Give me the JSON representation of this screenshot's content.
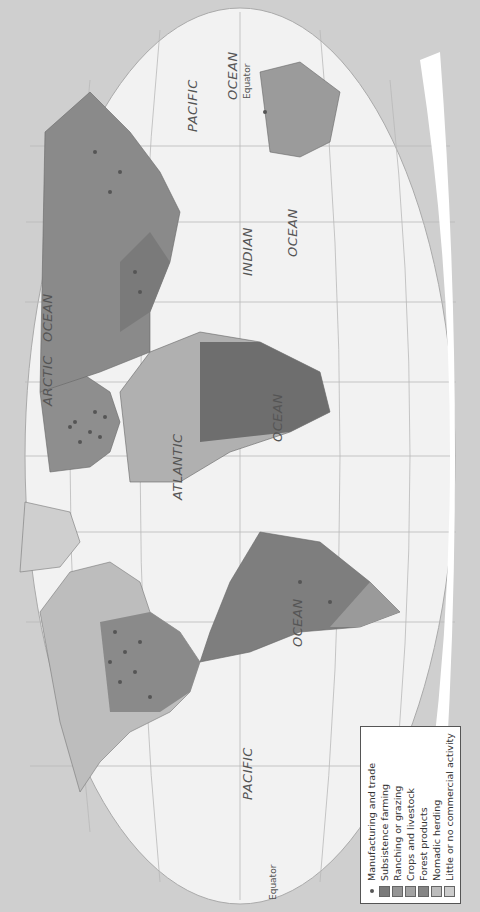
{
  "map": {
    "title": "World economic activity",
    "oceans": [
      {
        "label": "PACIFIC",
        "x": 112,
        "y": 240
      },
      {
        "label": "OCEAN",
        "x": 265,
        "y": 290
      },
      {
        "label": "ATLANTIC",
        "x": 412,
        "y": 170
      },
      {
        "label": "OCEAN",
        "x": 470,
        "y": 270
      },
      {
        "label": "ARCTIC",
        "x": 506,
        "y": 40
      },
      {
        "label": "OCEAN",
        "x": 570,
        "y": 40
      },
      {
        "label": "INDIAN",
        "x": 636,
        "y": 240
      },
      {
        "label": "OCEAN",
        "x": 655,
        "y": 285
      },
      {
        "label": "PACIFIC",
        "x": 780,
        "y": 185
      },
      {
        "label": "OCEAN",
        "x": 812,
        "y": 225
      }
    ],
    "equator_labels": [
      {
        "label": "Equator",
        "x": 12,
        "y": 268
      },
      {
        "label": "Equator",
        "x": 813,
        "y": 242
      }
    ]
  },
  "legend": {
    "items": [
      {
        "label": "Manufacturing and trade",
        "type": "dot",
        "color": "#555555"
      },
      {
        "label": "Subsistence farming",
        "type": "swatch",
        "color": "#7a7a7a"
      },
      {
        "label": "Ranching or grazing",
        "type": "swatch",
        "color": "#959595"
      },
      {
        "label": "Crops and livestock",
        "type": "swatch",
        "color": "#a3a3a3"
      },
      {
        "label": "Forest products",
        "type": "swatch",
        "color": "#858585"
      },
      {
        "label": "Nomadic herding",
        "type": "swatch",
        "color": "#bcbcbc"
      },
      {
        "label": "Little or no commercial activity",
        "type": "swatch",
        "color": "#cccccc"
      }
    ]
  },
  "colors": {
    "background": "#cfcfcf",
    "ocean": "#f2f2f2",
    "graticule": "#b5b5b5"
  }
}
